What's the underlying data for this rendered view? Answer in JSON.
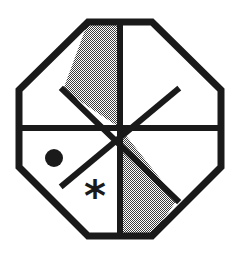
{
  "figure": {
    "shape_name": "octagon",
    "sector_count": 8,
    "line_color": "#1a1a1a",
    "shaded_fill_color": "#808080",
    "unshaded_fill_color": "#ffffff",
    "background_color": "#ffffff",
    "shading_pattern": "checkerboard-dither-50",
    "stroke_width": 6,
    "center": {
      "x": 120,
      "y": 128
    },
    "outline_vertices": [
      {
        "name": "top-left",
        "x": 88,
        "y": 22
      },
      {
        "name": "top-right",
        "x": 152,
        "y": 22
      },
      {
        "name": "right-top",
        "x": 221,
        "y": 90
      },
      {
        "name": "right-bottom",
        "x": 221,
        "y": 167
      },
      {
        "name": "bottom-right",
        "x": 152,
        "y": 236
      },
      {
        "name": "bottom-left",
        "x": 88,
        "y": 236
      },
      {
        "name": "left-bottom",
        "x": 19,
        "y": 167
      },
      {
        "name": "left-top",
        "x": 19,
        "y": 90
      }
    ],
    "divider_lines": [
      {
        "name": "vertical-divider",
        "x1": 120,
        "y1": 22,
        "x2": 120,
        "y2": 236
      },
      {
        "name": "horizontal-divider",
        "x1": 19,
        "y1": 128,
        "x2": 221,
        "y2": 128
      },
      {
        "name": "diagonal-nw-se",
        "x1": 63,
        "y1": 90,
        "x2": 177,
        "y2": 200
      },
      {
        "name": "diagonal-ne-sw",
        "x1": 177,
        "y1": 90,
        "x2": 63,
        "y2": 185
      }
    ],
    "sectors": [
      {
        "id": "sector-n-nw",
        "label": "north-northwest",
        "shaded": true,
        "points": "88,22 120,22 120,128 63,90"
      },
      {
        "id": "sector-n-ne",
        "label": "north-northeast",
        "shaded": false,
        "points": "120,22 152,22 177,90 120,128"
      },
      {
        "id": "sector-e-ne",
        "label": "east-northeast",
        "shaded": false,
        "points": "177,90 221,90 221,128 120,128"
      },
      {
        "id": "sector-e-se",
        "label": "east-southeast",
        "shaded": false,
        "points": "120,128 221,128 221,167 177,200"
      },
      {
        "id": "sector-s-se",
        "label": "south-southeast",
        "shaded": true,
        "points": "120,128 177,200 152,236 120,236"
      },
      {
        "id": "sector-s-sw",
        "label": "south-southwest",
        "shaded": false,
        "points": "120,128 120,236 88,236 63,185"
      },
      {
        "id": "sector-w-sw",
        "label": "west-southwest",
        "shaded": false,
        "points": "120,128 63,185 19,167 19,128"
      },
      {
        "id": "sector-w-nw",
        "label": "west-northwest",
        "shaded": false,
        "points": "19,90 63,90 120,128 19,128"
      }
    ],
    "markers": [
      {
        "id": "dot-marker",
        "glyph": "dot",
        "sector": "west-southwest",
        "x": 54,
        "y": 158,
        "radius": 9,
        "color": "#1a1a1a"
      },
      {
        "id": "asterisk-marker",
        "glyph": "*",
        "sector": "south-southwest",
        "x": 95,
        "y": 196,
        "size": 34,
        "color": "#1a1a1a"
      }
    ]
  }
}
